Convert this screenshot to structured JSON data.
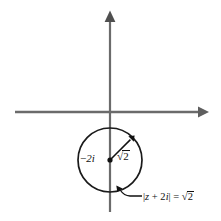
{
  "figure": {
    "kind": "complex-plane-circle-diagram",
    "width": 221,
    "height": 221,
    "background_color": "#ffffff",
    "axis_color": "#6b6b6b",
    "curve_color": "#1a1a1a",
    "text_color": "#111111",
    "axes": {
      "real_axis": {
        "label": "",
        "y": 112,
        "x_start": 15,
        "x_end": 207,
        "arrow_at": "right"
      },
      "imaginary_axis": {
        "label": "",
        "x": 110,
        "y_start": 212,
        "y_end": 11,
        "arrow_at": "top"
      }
    },
    "circle": {
      "center_x": 110,
      "center_y": 160,
      "radius": 32,
      "center_label": "−2i",
      "center_label_minus": "−",
      "center_label_rest": "2i",
      "center_point_marked": true
    },
    "radius_arrow": {
      "from_x": 110,
      "from_y": 160,
      "to_x": 133,
      "to_y": 137,
      "label_sign": "√",
      "label_radicand": "2",
      "label_text": "√2"
    },
    "callout": {
      "equation_text": "|z + 2i| = √2",
      "bar_open": "|",
      "var": "z",
      "plus": " + 2",
      "var_i": "i",
      "bar_close": "|",
      "equals": " = ",
      "sign": "√",
      "radicand": "2",
      "leader_from_x": 143,
      "leader_from_y": 196,
      "leader_to_x": 116,
      "leader_to_y": 186
    }
  }
}
